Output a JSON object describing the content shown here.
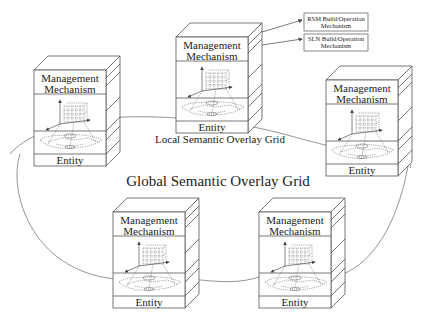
{
  "title": "Global Semantic Overlay Grid",
  "local_caption": "Local Semantic Overlay Grid",
  "node_labels": {
    "management_line1": "Management",
    "management_line2": "Mechanism",
    "entity": "Entity"
  },
  "callouts": [
    {
      "line1": "RSM Build/Operation",
      "line2": "Mechanism"
    },
    {
      "line1": "SLN Build/Operation",
      "line2": "Mechanism"
    }
  ],
  "nodes": [
    {
      "id": "center-top",
      "x": 176,
      "y": 37
    },
    {
      "id": "left",
      "x": 34,
      "y": 69
    },
    {
      "id": "right",
      "x": 326,
      "y": 80
    },
    {
      "id": "bottom-left",
      "x": 113,
      "y": 212
    },
    {
      "id": "bottom-right",
      "x": 259,
      "y": 212
    }
  ],
  "colors": {
    "line": "#555555",
    "text": "#222222",
    "background": "#ffffff"
  }
}
